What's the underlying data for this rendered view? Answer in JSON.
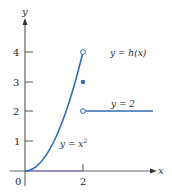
{
  "figure": {
    "axes": {
      "x_label": "x",
      "y_label": "y",
      "origin_label": "0",
      "x_ticks": [
        {
          "value": 2,
          "label": "2"
        }
      ],
      "y_ticks": [
        {
          "value": 1,
          "label": "1"
        },
        {
          "value": 2,
          "label": "2"
        },
        {
          "value": 3,
          "label": "3"
        },
        {
          "value": 4,
          "label": "4"
        }
      ]
    },
    "annotations": {
      "function_label": "y = h(x)",
      "parabola_label_base": "y = x",
      "parabola_label_exp": "2",
      "line_label": "y = 2"
    },
    "points": [
      {
        "x": 2,
        "y": 4,
        "type": "open"
      },
      {
        "x": 2,
        "y": 3,
        "type": "filled"
      },
      {
        "x": 2,
        "y": 2,
        "type": "open"
      }
    ],
    "colors": {
      "curve": "#2f6db5",
      "axis": "#555555",
      "text": "#2a2a2a"
    }
  }
}
